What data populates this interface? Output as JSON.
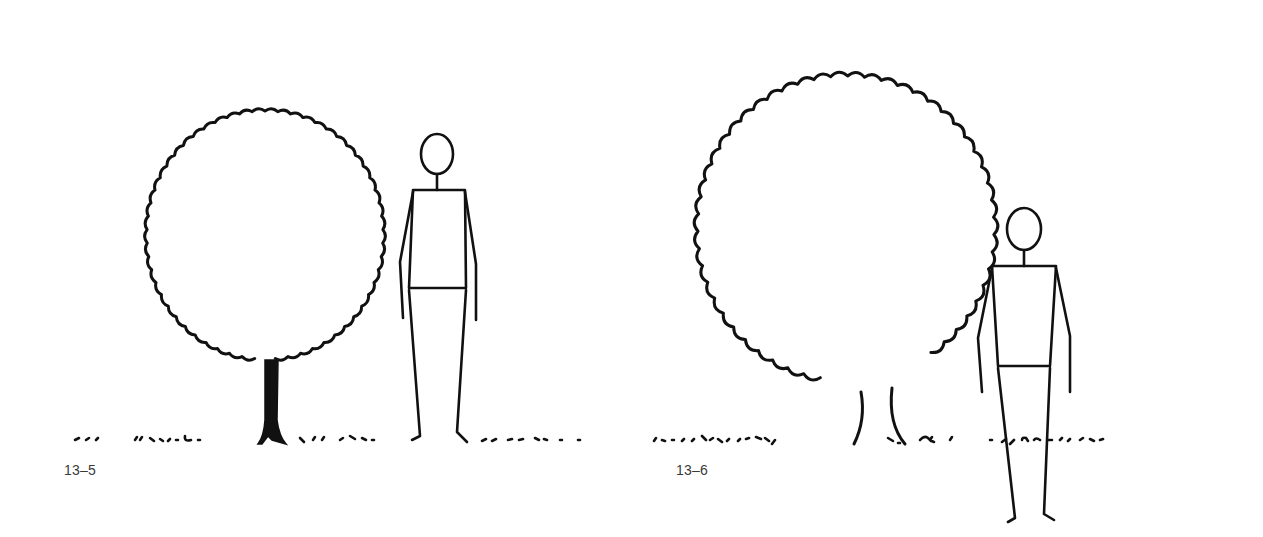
{
  "figures": [
    {
      "id": "13-5",
      "caption": "13–5",
      "elements": [
        "round-tree-canopy",
        "solid-tree-trunk",
        "standing-person",
        "ground-grass-line"
      ],
      "ink_color": "#111111"
    },
    {
      "id": "13-6",
      "caption": "13–6",
      "elements": [
        "large-round-tree-canopy",
        "open-tree-trunk",
        "standing-person",
        "ground-grass-line"
      ],
      "ink_color": "#111111"
    }
  ],
  "background": "#ffffff"
}
